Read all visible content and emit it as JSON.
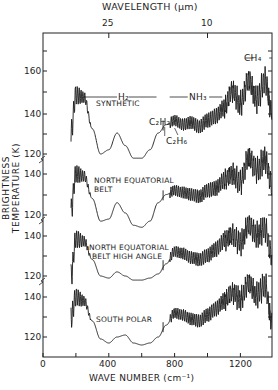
{
  "chart_data": {
    "type": "line",
    "title": "",
    "xlabel": "WAVE NUMBER (cm⁻¹)",
    "ylabel": "BRIGHTNESS TEMPERATURE (K)",
    "top_xlabel": "WAVELENGTH (μm)",
    "xlim": [
      0,
      1400
    ],
    "x_ticks": [
      0,
      400,
      800,
      1200
    ],
    "x_tick_labels": [
      "0",
      "400",
      "800",
      "1200"
    ],
    "top_ticks": [
      {
        "label": "25",
        "wavenumber": 400
      },
      {
        "label": "10",
        "wavenumber": 1000
      }
    ],
    "grid": false,
    "legend": null,
    "annotations": [
      {
        "text": "H₂",
        "x_range": [
          250,
          700
        ]
      },
      {
        "text": "NH₃",
        "x_range": [
          770,
          1100
        ]
      },
      {
        "text": "CH₄",
        "x_range": [
          1230,
          1390
        ]
      },
      {
        "text": "C₂H₂",
        "x": 730
      },
      {
        "text": "C₂H₆",
        "x": 820
      }
    ],
    "series": [
      {
        "name": "SYNTHETIC",
        "y_ticks": [
          120,
          140,
          160
        ],
        "x": [
          170,
          200,
          250,
          300,
          350,
          400,
          450,
          500,
          550,
          600,
          650,
          700,
          750,
          800,
          850,
          900,
          950,
          1000,
          1050,
          1100,
          1150,
          1200,
          1250,
          1300,
          1350,
          1390
        ],
        "values": [
          130,
          148,
          147,
          132,
          120,
          122,
          130,
          124,
          118,
          118,
          122,
          130,
          134,
          136,
          134,
          135,
          133,
          136,
          138,
          142,
          150,
          144,
          155,
          146,
          155,
          140
        ]
      },
      {
        "name": "NORTH EQUATORIAL BELT",
        "y_ticks": [
          120,
          140
        ],
        "x": [
          170,
          200,
          250,
          300,
          350,
          400,
          450,
          500,
          550,
          600,
          650,
          700,
          750,
          800,
          850,
          900,
          950,
          1000,
          1050,
          1100,
          1150,
          1200,
          1250,
          1300,
          1350,
          1390
        ],
        "values": [
          122,
          140,
          139,
          128,
          117,
          118,
          126,
          121,
          115,
          114,
          117,
          126,
          130,
          132,
          131,
          130,
          129,
          132,
          133,
          137,
          140,
          136,
          148,
          142,
          147,
          135
        ]
      },
      {
        "name": "NORTH EQUATORIAL BELT HIGH ANGLE",
        "y_ticks": [
          120,
          140
        ],
        "x": [
          170,
          200,
          250,
          300,
          350,
          400,
          450,
          500,
          550,
          600,
          650,
          700,
          750,
          800,
          850,
          900,
          950,
          1000,
          1050,
          1100,
          1150,
          1200,
          1250,
          1300,
          1350,
          1390
        ],
        "values": [
          120,
          138,
          137,
          128,
          120,
          119,
          122,
          120,
          118,
          118,
          119,
          121,
          126,
          132,
          131,
          129,
          128,
          130,
          133,
          137,
          140,
          136,
          145,
          140,
          143,
          130
        ]
      },
      {
        "name": "SOUTH POLAR",
        "y_ticks": [
          120,
          140
        ],
        "x": [
          170,
          200,
          250,
          300,
          350,
          400,
          450,
          500,
          550,
          600,
          650,
          700,
          750,
          800,
          850,
          900,
          950,
          1000,
          1050,
          1100,
          1150,
          1200,
          1250,
          1300,
          1350,
          1390
        ],
        "values": [
          130,
          140,
          138,
          128,
          119,
          117,
          120,
          121,
          117,
          116,
          117,
          120,
          126,
          132,
          131,
          129,
          128,
          131,
          134,
          138,
          142,
          139,
          147,
          141,
          146,
          128
        ]
      }
    ]
  },
  "labels": {
    "top_axis_title": "WAVELENGTH (μm)",
    "top_tick_25": "25",
    "top_tick_10": "10",
    "bottom_axis_title": "WAVE NUMBER (cm⁻¹)",
    "x0": "0",
    "x400": "400",
    "x800": "800",
    "x1200": "1200",
    "y_axis_title": "BRIGHTNESS TEMPERATURE (K)",
    "y_ticks": [
      "160",
      "140",
      "120",
      "140",
      "120",
      "140",
      "120",
      "140",
      "120"
    ],
    "h2": "H₂",
    "nh3": "NH₃",
    "ch4": "CH₄",
    "c2h2": "C₂H₂",
    "c2h6": "C₂H₆",
    "panel1": "SYNTHETIC",
    "panel2_line1": "NORTH EQUATORIAL",
    "panel2_line2": "BELT",
    "panel3_line1": "NORTH EQUATORIAL",
    "panel3_line2": "BELT HIGH ANGLE",
    "panel4": "SOUTH POLAR"
  }
}
